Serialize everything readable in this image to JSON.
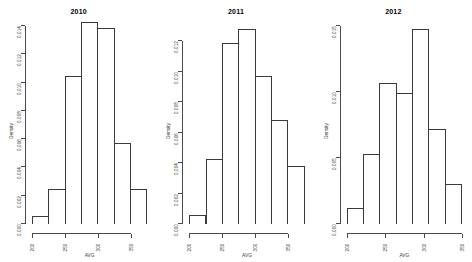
{
  "figure": {
    "background_color": "#ffffff",
    "line_color": "#3a3a3a",
    "panel_count": 3
  },
  "chart_data": [
    {
      "type": "bar",
      "title": "2010",
      "xlabel": "AVG",
      "ylabel": "Density",
      "grid": false,
      "legend": "none",
      "xlim": [
        200,
        375
      ],
      "ylim": [
        0,
        0.014
      ],
      "bin_width": 25,
      "xticks": [
        200,
        250,
        300,
        350
      ],
      "xtick_labels": [
        "200",
        "250",
        "300",
        "350"
      ],
      "yticks": [
        0.0,
        0.002,
        0.004,
        0.006,
        0.008,
        0.01,
        0.012,
        0.014
      ],
      "ytick_labels": [
        "0.000",
        "0.002",
        "0.004",
        "0.006",
        "0.008",
        "0.010",
        "0.012",
        "0.014"
      ],
      "bin_edges": [
        200,
        225,
        250,
        275,
        300,
        325,
        350,
        375
      ],
      "categories": [
        "200-225",
        "225-250",
        "250-275",
        "275-300",
        "300-325",
        "325-350",
        "350-375"
      ],
      "values": [
        0.00055,
        0.00245,
        0.01045,
        0.0143,
        0.01385,
        0.0057,
        0.00245
      ]
    },
    {
      "type": "bar",
      "title": "2011",
      "xlabel": "AVG",
      "ylabel": "Density",
      "grid": false,
      "legend": "none",
      "xlim": [
        200,
        375
      ],
      "ylim": [
        0,
        0.013
      ],
      "bin_width": 25,
      "xticks": [
        200,
        250,
        300,
        350
      ],
      "xtick_labels": [
        "200",
        "250",
        "300",
        "350"
      ],
      "yticks": [
        0.0,
        0.002,
        0.004,
        0.006,
        0.008,
        0.01,
        0.012
      ],
      "ytick_labels": [
        "0.000",
        "0.002",
        "0.004",
        "0.006",
        "0.008",
        "0.010",
        "0.012"
      ],
      "bin_edges": [
        200,
        225,
        250,
        275,
        300,
        325,
        350,
        375
      ],
      "categories": [
        "200-225",
        "225-250",
        "250-275",
        "275-300",
        "300-325",
        "325-350",
        "350-375"
      ],
      "values": [
        0.0006,
        0.0043,
        0.0119,
        0.0128,
        0.00975,
        0.0068,
        0.0038
      ]
    },
    {
      "type": "bar",
      "title": "2012",
      "xlabel": "AVG",
      "ylabel": "Density",
      "grid": false,
      "legend": "none",
      "xlim": [
        200,
        350
      ],
      "ylim": [
        0,
        0.015
      ],
      "bin_width": 25,
      "xticks": [
        200,
        250,
        300,
        350
      ],
      "xtick_labels": [
        "200",
        "250",
        "300",
        "350"
      ],
      "yticks": [
        0.0,
        0.005,
        0.01,
        0.015
      ],
      "ytick_labels": [
        "0.000",
        "0.005",
        "0.010",
        "0.015"
      ],
      "bin_edges": [
        200,
        225,
        250,
        275,
        300,
        325,
        350
      ],
      "categories": [
        "200-225",
        "225-250",
        "250-275",
        "275-300",
        "300-325",
        "325-350"
      ],
      "values": [
        0.0012,
        0.0053,
        0.0107,
        0.0099,
        0.0148,
        0.0072,
        0.003
      ]
    }
  ]
}
